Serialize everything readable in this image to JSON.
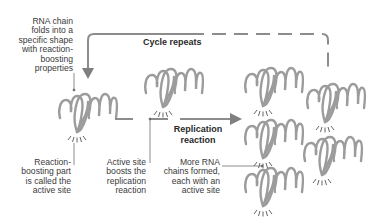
{
  "colors": {
    "rna_chain": "#9c9c9c",
    "cycle_line": "#8c8c8c",
    "arrow": "#7f7f7f",
    "leader_line": "#707070",
    "text": "#3a3a3a",
    "background": "#ffffff"
  },
  "labels": {
    "fold": [
      "RNA chain",
      "folds into a",
      "specific shape",
      "with reaction-",
      "boosting",
      "properties"
    ],
    "cycle": "Cycle repeats",
    "active_site_def": [
      "Reaction-",
      "boosting part",
      "is called the",
      "active site"
    ],
    "active_site_boost": [
      "Active site",
      "boosts the",
      "replication",
      "reaction"
    ],
    "replication": [
      "Replication",
      "reaction"
    ],
    "more_chains": [
      "More RNA",
      "chains formed,",
      "each with an",
      "active site"
    ]
  },
  "molecules": [
    {
      "name": "folded-rna-chain",
      "x": 58,
      "y": 88
    },
    {
      "name": "rna-chain-active",
      "x": 144,
      "y": 63
    },
    {
      "name": "new-rna-chain-1",
      "x": 244,
      "y": 62
    },
    {
      "name": "new-rna-chain-2",
      "x": 306,
      "y": 78
    },
    {
      "name": "new-rna-chain-3",
      "x": 244,
      "y": 114
    },
    {
      "name": "new-rna-chain-4",
      "x": 303,
      "y": 131
    },
    {
      "name": "new-rna-chain-5",
      "x": 244,
      "y": 164
    }
  ]
}
